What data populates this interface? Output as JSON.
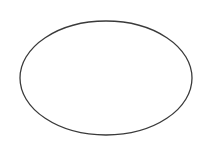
{
  "diagram": {
    "shapes": [
      {
        "type": "ellipse",
        "cx": 106,
        "cy": 78,
        "rx": 86,
        "ry": 57,
        "stroke": "#3a3a3a",
        "stroke_width": 1.3,
        "fill": "#ffffff"
      }
    ],
    "background": "#ffffff"
  }
}
